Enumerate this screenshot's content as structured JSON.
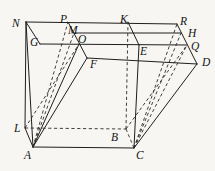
{
  "figure": {
    "background_color": "#f7f6f2",
    "line_color": "#1e1e1e",
    "width": 215,
    "height": 171,
    "points": {
      "N": [
        26,
        22
      ],
      "P": [
        68,
        22
      ],
      "K": [
        128,
        22
      ],
      "R": [
        177,
        24
      ],
      "G": [
        40,
        44
      ],
      "M": [
        74,
        33
      ],
      "O": [
        79,
        44
      ],
      "E": [
        139,
        45
      ],
      "H": [
        181,
        33
      ],
      "Q": [
        187,
        45
      ],
      "F": [
        87,
        58
      ],
      "D": [
        197,
        64
      ],
      "L": [
        25,
        128
      ],
      "A": [
        33,
        147
      ],
      "B": [
        126,
        129
      ],
      "C": [
        134,
        148
      ]
    },
    "edges": [
      {
        "from": "N",
        "to": "R",
        "style": "solid"
      },
      {
        "from": "N",
        "to": "G",
        "style": "solid"
      },
      {
        "from": "N",
        "to": "A",
        "style": "solid"
      },
      {
        "from": "L",
        "to": "N",
        "style": "solid"
      },
      {
        "from": "G",
        "to": "Q",
        "style": "solid"
      },
      {
        "from": "A",
        "to": "C",
        "style": "solid"
      },
      {
        "from": "A",
        "to": "L",
        "style": "solid"
      },
      {
        "from": "C",
        "to": "D",
        "style": "solid"
      },
      {
        "from": "R",
        "to": "D",
        "style": "solid"
      },
      {
        "from": "F",
        "to": "D",
        "style": "solid"
      },
      {
        "from": "M",
        "to": "H",
        "style": "solid"
      },
      {
        "from": "P",
        "to": "F",
        "style": "solid"
      },
      {
        "from": "K",
        "to": "E",
        "style": "solid"
      },
      {
        "from": "C",
        "to": "E",
        "style": "solid"
      },
      {
        "from": "A",
        "to": "O",
        "style": "solid"
      },
      {
        "from": "A",
        "to": "F",
        "style": "solid"
      },
      {
        "from": "L",
        "to": "B",
        "style": "dashed"
      },
      {
        "from": "B",
        "to": "C",
        "style": "dashed"
      },
      {
        "from": "B",
        "to": "K",
        "style": "dashed"
      },
      {
        "from": "B",
        "to": "Q",
        "style": "dashed"
      },
      {
        "from": "A",
        "to": "P",
        "style": "dashed"
      },
      {
        "from": "A",
        "to": "M",
        "style": "dashed"
      },
      {
        "from": "L",
        "to": "O",
        "style": "dashed"
      },
      {
        "from": "C",
        "to": "R",
        "style": "dashed"
      },
      {
        "from": "C",
        "to": "H",
        "style": "dashed"
      },
      {
        "from": "C",
        "to": "Q",
        "style": "dashed"
      }
    ],
    "labels": [
      {
        "text": "N",
        "x": 12,
        "y": 27
      },
      {
        "text": "P",
        "x": 60,
        "y": 23
      },
      {
        "text": "K",
        "x": 120,
        "y": 23
      },
      {
        "text": "R",
        "x": 180,
        "y": 25
      },
      {
        "text": "G",
        "x": 30,
        "y": 46
      },
      {
        "text": "M",
        "x": 68,
        "y": 34
      },
      {
        "text": "O",
        "x": 78,
        "y": 43
      },
      {
        "text": "E",
        "x": 140,
        "y": 55
      },
      {
        "text": "H",
        "x": 188,
        "y": 37
      },
      {
        "text": "Q",
        "x": 191,
        "y": 50
      },
      {
        "text": "F",
        "x": 90,
        "y": 68
      },
      {
        "text": "D",
        "x": 202,
        "y": 66
      },
      {
        "text": "L",
        "x": 14,
        "y": 132
      },
      {
        "text": "A",
        "x": 24,
        "y": 159
      },
      {
        "text": "B",
        "x": 111,
        "y": 141
      },
      {
        "text": "C",
        "x": 136,
        "y": 159
      }
    ]
  }
}
